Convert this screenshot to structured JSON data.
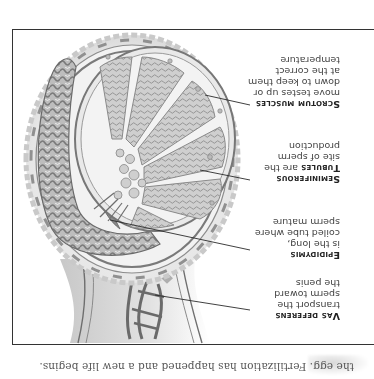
{
  "page": {
    "orientation": "rotated 180 degrees",
    "caption": "the egg. Fertilization has happened and a new life begins."
  },
  "figure": {
    "labels": [
      {
        "id": "vas-deferens",
        "heading": "Vas deferens",
        "lines": [
          "transport the",
          "sperm toward",
          "the penis"
        ]
      },
      {
        "id": "epididymis",
        "heading": "Epididymis",
        "lines": [
          "is the long,",
          "coiled tube where",
          "sperm mature"
        ]
      },
      {
        "id": "seminiferous-tubules",
        "heading": "Seminiferous",
        "heading_cont": "Tubules",
        "heading_cont_tail": " are the",
        "lines": [
          "site of sperm",
          "production"
        ]
      },
      {
        "id": "scrotum-muscles",
        "heading": "Scrotum muscles",
        "lines": [
          "move testes up or",
          "down to keep them",
          "at the correct",
          "temperature"
        ]
      }
    ],
    "colors": {
      "frame": "#333333",
      "outline": "#6e6e6e",
      "tissue_light": "#e4e4e4",
      "tissue_mid": "#b4b4b4",
      "tissue_dark": "#7c7c7c",
      "leader": "#2b2b2b"
    }
  }
}
